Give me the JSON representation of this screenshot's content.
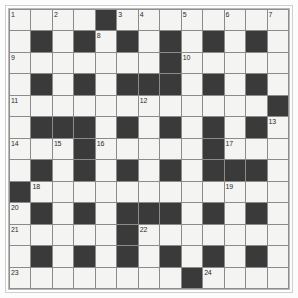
{
  "puzzle": {
    "type": "crossword-grid",
    "title": "",
    "rows": 13,
    "columns": 13,
    "colors": {
      "page_background": "#fcfcfc",
      "white_cell": "#f4f4f2",
      "black_cell": "#3a3a3a",
      "grid_line": "#8b8b8b",
      "outer_frame": "#cfcfcf",
      "inner_frame": "#b9b9b9",
      "number_text": "#2b2b2b"
    },
    "clue_numbers_present": [
      1,
      2,
      3,
      4,
      5,
      6,
      7,
      8,
      9,
      10,
      11,
      12,
      13,
      14,
      15,
      16,
      17,
      18,
      19,
      20,
      21,
      22,
      23,
      24
    ],
    "max_clue_number": 24,
    "grid": [
      [
        {
          "black": false,
          "num": "1"
        },
        {
          "black": false,
          "num": ""
        },
        {
          "black": false,
          "num": "2"
        },
        {
          "black": false,
          "num": ""
        },
        {
          "black": true,
          "num": ""
        },
        {
          "black": false,
          "num": "3"
        },
        {
          "black": false,
          "num": "4"
        },
        {
          "black": false,
          "num": ""
        },
        {
          "black": false,
          "num": "5"
        },
        {
          "black": false,
          "num": ""
        },
        {
          "black": false,
          "num": "6"
        },
        {
          "black": false,
          "num": ""
        },
        {
          "black": false,
          "num": "7"
        }
      ],
      [
        {
          "black": false,
          "num": ""
        },
        {
          "black": true,
          "num": ""
        },
        {
          "black": false,
          "num": ""
        },
        {
          "black": true,
          "num": ""
        },
        {
          "black": false,
          "num": "8"
        },
        {
          "black": true,
          "num": ""
        },
        {
          "black": false,
          "num": ""
        },
        {
          "black": true,
          "num": ""
        },
        {
          "black": false,
          "num": ""
        },
        {
          "black": true,
          "num": ""
        },
        {
          "black": false,
          "num": ""
        },
        {
          "black": true,
          "num": ""
        },
        {
          "black": false,
          "num": ""
        }
      ],
      [
        {
          "black": false,
          "num": "9"
        },
        {
          "black": false,
          "num": ""
        },
        {
          "black": false,
          "num": ""
        },
        {
          "black": false,
          "num": ""
        },
        {
          "black": false,
          "num": ""
        },
        {
          "black": false,
          "num": ""
        },
        {
          "black": false,
          "num": ""
        },
        {
          "black": true,
          "num": ""
        },
        {
          "black": false,
          "num": "10"
        },
        {
          "black": false,
          "num": ""
        },
        {
          "black": false,
          "num": ""
        },
        {
          "black": false,
          "num": ""
        },
        {
          "black": false,
          "num": ""
        }
      ],
      [
        {
          "black": false,
          "num": ""
        },
        {
          "black": true,
          "num": ""
        },
        {
          "black": false,
          "num": ""
        },
        {
          "black": true,
          "num": ""
        },
        {
          "black": false,
          "num": ""
        },
        {
          "black": true,
          "num": ""
        },
        {
          "black": true,
          "num": ""
        },
        {
          "black": true,
          "num": ""
        },
        {
          "black": false,
          "num": ""
        },
        {
          "black": true,
          "num": ""
        },
        {
          "black": false,
          "num": ""
        },
        {
          "black": true,
          "num": ""
        },
        {
          "black": false,
          "num": ""
        }
      ],
      [
        {
          "black": false,
          "num": "11"
        },
        {
          "black": false,
          "num": ""
        },
        {
          "black": false,
          "num": ""
        },
        {
          "black": false,
          "num": ""
        },
        {
          "black": false,
          "num": ""
        },
        {
          "black": false,
          "num": ""
        },
        {
          "black": false,
          "num": "12"
        },
        {
          "black": false,
          "num": ""
        },
        {
          "black": false,
          "num": ""
        },
        {
          "black": false,
          "num": ""
        },
        {
          "black": false,
          "num": ""
        },
        {
          "black": false,
          "num": ""
        },
        {
          "black": true,
          "num": ""
        }
      ],
      [
        {
          "black": false,
          "num": ""
        },
        {
          "black": true,
          "num": ""
        },
        {
          "black": true,
          "num": ""
        },
        {
          "black": true,
          "num": ""
        },
        {
          "black": false,
          "num": ""
        },
        {
          "black": true,
          "num": ""
        },
        {
          "black": false,
          "num": ""
        },
        {
          "black": true,
          "num": ""
        },
        {
          "black": false,
          "num": ""
        },
        {
          "black": true,
          "num": ""
        },
        {
          "black": false,
          "num": ""
        },
        {
          "black": true,
          "num": ""
        },
        {
          "black": false,
          "num": "13"
        }
      ],
      [
        {
          "black": false,
          "num": "14"
        },
        {
          "black": false,
          "num": ""
        },
        {
          "black": false,
          "num": "15"
        },
        {
          "black": true,
          "num": ""
        },
        {
          "black": false,
          "num": "16"
        },
        {
          "black": false,
          "num": ""
        },
        {
          "black": false,
          "num": ""
        },
        {
          "black": false,
          "num": ""
        },
        {
          "black": false,
          "num": ""
        },
        {
          "black": true,
          "num": ""
        },
        {
          "black": false,
          "num": "17"
        },
        {
          "black": false,
          "num": ""
        },
        {
          "black": false,
          "num": ""
        }
      ],
      [
        {
          "black": false,
          "num": ""
        },
        {
          "black": true,
          "num": ""
        },
        {
          "black": false,
          "num": ""
        },
        {
          "black": true,
          "num": ""
        },
        {
          "black": false,
          "num": ""
        },
        {
          "black": true,
          "num": ""
        },
        {
          "black": false,
          "num": ""
        },
        {
          "black": true,
          "num": ""
        },
        {
          "black": false,
          "num": ""
        },
        {
          "black": true,
          "num": ""
        },
        {
          "black": true,
          "num": ""
        },
        {
          "black": true,
          "num": ""
        },
        {
          "black": false,
          "num": ""
        }
      ],
      [
        {
          "black": true,
          "num": ""
        },
        {
          "black": false,
          "num": "18"
        },
        {
          "black": false,
          "num": ""
        },
        {
          "black": false,
          "num": ""
        },
        {
          "black": false,
          "num": ""
        },
        {
          "black": false,
          "num": ""
        },
        {
          "black": false,
          "num": ""
        },
        {
          "black": false,
          "num": ""
        },
        {
          "black": false,
          "num": ""
        },
        {
          "black": false,
          "num": ""
        },
        {
          "black": false,
          "num": "19"
        },
        {
          "black": false,
          "num": ""
        },
        {
          "black": false,
          "num": ""
        }
      ],
      [
        {
          "black": false,
          "num": "20"
        },
        {
          "black": true,
          "num": ""
        },
        {
          "black": false,
          "num": ""
        },
        {
          "black": true,
          "num": ""
        },
        {
          "black": false,
          "num": ""
        },
        {
          "black": true,
          "num": ""
        },
        {
          "black": true,
          "num": ""
        },
        {
          "black": true,
          "num": ""
        },
        {
          "black": false,
          "num": ""
        },
        {
          "black": true,
          "num": ""
        },
        {
          "black": false,
          "num": ""
        },
        {
          "black": true,
          "num": ""
        },
        {
          "black": false,
          "num": ""
        }
      ],
      [
        {
          "black": false,
          "num": "21"
        },
        {
          "black": false,
          "num": ""
        },
        {
          "black": false,
          "num": ""
        },
        {
          "black": false,
          "num": ""
        },
        {
          "black": false,
          "num": ""
        },
        {
          "black": true,
          "num": ""
        },
        {
          "black": false,
          "num": "22"
        },
        {
          "black": false,
          "num": ""
        },
        {
          "black": false,
          "num": ""
        },
        {
          "black": false,
          "num": ""
        },
        {
          "black": false,
          "num": ""
        },
        {
          "black": false,
          "num": ""
        },
        {
          "black": false,
          "num": ""
        }
      ],
      [
        {
          "black": false,
          "num": ""
        },
        {
          "black": true,
          "num": ""
        },
        {
          "black": false,
          "num": ""
        },
        {
          "black": true,
          "num": ""
        },
        {
          "black": false,
          "num": ""
        },
        {
          "black": true,
          "num": ""
        },
        {
          "black": false,
          "num": ""
        },
        {
          "black": true,
          "num": ""
        },
        {
          "black": false,
          "num": ""
        },
        {
          "black": true,
          "num": ""
        },
        {
          "black": false,
          "num": ""
        },
        {
          "black": true,
          "num": ""
        },
        {
          "black": false,
          "num": ""
        }
      ],
      [
        {
          "black": false,
          "num": "23"
        },
        {
          "black": false,
          "num": ""
        },
        {
          "black": false,
          "num": ""
        },
        {
          "black": false,
          "num": ""
        },
        {
          "black": false,
          "num": ""
        },
        {
          "black": false,
          "num": ""
        },
        {
          "black": false,
          "num": ""
        },
        {
          "black": false,
          "num": ""
        },
        {
          "black": true,
          "num": ""
        },
        {
          "black": false,
          "num": "24"
        },
        {
          "black": false,
          "num": ""
        },
        {
          "black": false,
          "num": ""
        },
        {
          "black": false,
          "num": ""
        }
      ]
    ]
  }
}
